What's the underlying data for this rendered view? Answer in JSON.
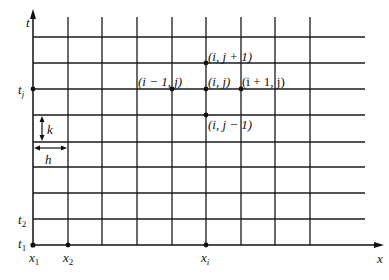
{
  "diagram": {
    "type": "finite-difference-grid",
    "axes": {
      "x_label": "x",
      "y_label": "t"
    },
    "grid": {
      "vertical_lines_x": [
        33,
        68,
        102,
        137,
        172,
        206,
        241,
        275,
        310
      ],
      "horizontal_lines_y": [
        37,
        63,
        89,
        115,
        142,
        167,
        193,
        219,
        245
      ]
    },
    "labels": {
      "t_axis": "t",
      "x_axis": "x",
      "tj": "t",
      "tj_sub": "j",
      "t2": "t",
      "t2_sub": "2",
      "t1": "t",
      "t1_sub": "1",
      "x1": "x",
      "x1_sub": "1",
      "x2": "x",
      "x2_sub": "2",
      "xi": "x",
      "xi_sub": "i",
      "k": "k",
      "h": "h"
    },
    "nodes": {
      "center": "(i, j)",
      "top": "(i, j + 1)",
      "bottom": "(i, j − 1)",
      "left": "(i − 1, j)",
      "right": "(i + 1, j)"
    }
  }
}
